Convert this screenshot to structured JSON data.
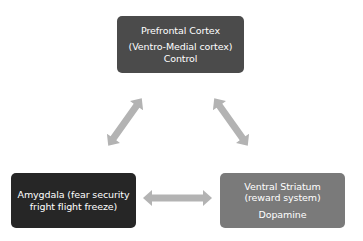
{
  "diagram": {
    "nodes": [
      {
        "id": "prefrontal-cortex",
        "lines": [
          "Prefrontal Cortex",
          "(Ventro-Medial cortex)",
          "Control"
        ],
        "color": "#4b4b4b"
      },
      {
        "id": "amygdala",
        "lines": [
          "Amygdala (fear security",
          "fright flight freeze)"
        ],
        "color": "#262626"
      },
      {
        "id": "ventral-striatum",
        "lines": [
          "Ventral Striatum",
          "(reward system)",
          "Dopamine"
        ],
        "color": "#7a7a7a"
      }
    ],
    "edges": [
      {
        "from": "prefrontal-cortex",
        "to": "amygdala",
        "type": "bidirectional"
      },
      {
        "from": "prefrontal-cortex",
        "to": "ventral-striatum",
        "type": "bidirectional"
      },
      {
        "from": "amygdala",
        "to": "ventral-striatum",
        "type": "bidirectional"
      }
    ],
    "arrow_color": "#b3b3b3",
    "background": "#ffffff"
  }
}
